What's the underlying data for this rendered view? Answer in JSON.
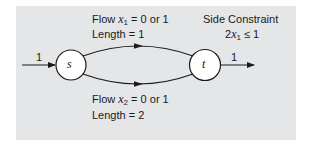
{
  "diagram": {
    "type": "network-flow",
    "background_color": "#e5e6e8",
    "nodes": [
      {
        "id": "s",
        "label": "s"
      },
      {
        "id": "t",
        "label": "t"
      }
    ],
    "input_flow": {
      "label": "1"
    },
    "output_flow": {
      "label": "1"
    },
    "arcs": [
      {
        "from": "s",
        "to": "t",
        "position": "upper",
        "flow_prefix": "Flow ",
        "flow_var": "x",
        "flow_sub": "1",
        "flow_suffix": " = 0 or 1",
        "length_label": "Length = 1"
      },
      {
        "from": "s",
        "to": "t",
        "position": "lower",
        "flow_prefix": "Flow ",
        "flow_var": "x",
        "flow_sub": "2",
        "flow_suffix": " = 0 or 1",
        "length_label": "Length = 2"
      }
    ],
    "side_constraint": {
      "title": "Side Constraint",
      "coef": "2",
      "var": "x",
      "sub": "1",
      "rel": " ≤ 1"
    }
  }
}
